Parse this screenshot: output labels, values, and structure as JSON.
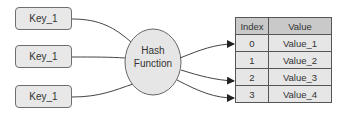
{
  "diagram": {
    "keys": [
      {
        "label": "Key_1"
      },
      {
        "label": "Key_1"
      },
      {
        "label": "Key_1"
      }
    ],
    "hash_function": {
      "line1": "Hash",
      "line2": "Function"
    },
    "table": {
      "headers": {
        "index": "Index",
        "value": "Value"
      },
      "rows": [
        {
          "index": "0",
          "value": "Value_1"
        },
        {
          "index": "1",
          "value": "Value_2"
        },
        {
          "index": "2",
          "value": "Value_3"
        },
        {
          "index": "3",
          "value": "Value_4"
        }
      ]
    },
    "colors": {
      "box_fill": "#e8e8e8",
      "header_fill": "#c9c9c9",
      "stroke": "#555555"
    }
  }
}
